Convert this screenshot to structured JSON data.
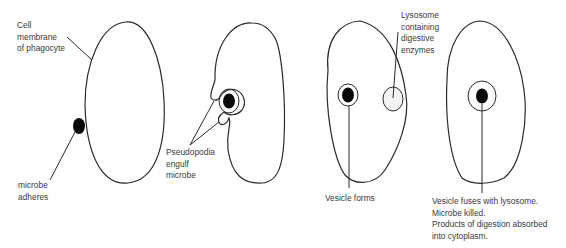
{
  "diagram": {
    "stages": [
      {
        "id": "stage-1",
        "labels": [
          {
            "key": "cell_membrane",
            "lines": [
              "Cell",
              "membrane",
              "of phagocyte"
            ]
          },
          {
            "key": "microbe_adheres",
            "lines": [
              "microbe",
              "adheres"
            ]
          }
        ]
      },
      {
        "id": "stage-2",
        "labels": [
          {
            "key": "pseudopodia",
            "lines": [
              "Pseudopodia",
              "engulf",
              "microbe"
            ]
          }
        ]
      },
      {
        "id": "stage-3",
        "labels": [
          {
            "key": "lysosome",
            "lines": [
              "Lysosome",
              "containing",
              "digestive",
              "enzymes"
            ]
          },
          {
            "key": "vesicle_forms",
            "lines": [
              "Vesicle forms"
            ]
          }
        ]
      },
      {
        "id": "stage-4",
        "labels": [
          {
            "key": "vesicle_fuses",
            "lines": [
              "Vesicle fuses with lysosome.",
              "Microbe killed.",
              "Products of digestion absorbed",
              "into cytoplasm."
            ]
          }
        ]
      }
    ],
    "colors": {
      "line": "#2a2a2a",
      "microbe": "#0a0a0a",
      "text": "#3a3a3a",
      "lysosome_fill": "#f4f4f4"
    }
  }
}
